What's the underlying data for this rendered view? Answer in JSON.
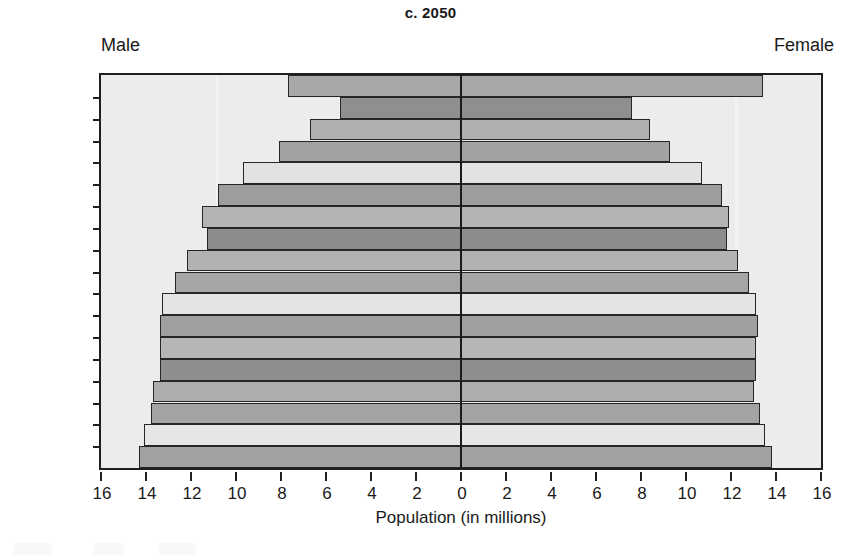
{
  "chart_data": {
    "type": "bar",
    "subtype": "population-pyramid",
    "title": "c. 2050",
    "xlabel": "Population (in millions)",
    "ylabel": "",
    "left_series_label": "Male",
    "right_series_label": "Female",
    "categories": [
      "85+",
      "80–84",
      "75–79",
      "70–74",
      "65–69",
      "60–64",
      "55–59",
      "50–54",
      "45–49",
      "40–44",
      "35–39",
      "30–34",
      "25–29",
      "20–24",
      "15–19",
      "10–14",
      "5–9",
      "0–4"
    ],
    "series": [
      {
        "name": "Male",
        "side": "left",
        "values": [
          7.7,
          5.4,
          6.7,
          8.1,
          9.7,
          10.8,
          11.5,
          11.3,
          12.2,
          12.7,
          13.3,
          13.4,
          13.4,
          13.4,
          13.7,
          13.8,
          14.1,
          14.3
        ]
      },
      {
        "name": "Female",
        "side": "right",
        "values": [
          13.4,
          7.6,
          8.4,
          9.3,
          10.7,
          11.6,
          11.9,
          11.8,
          12.3,
          12.8,
          13.1,
          13.2,
          13.1,
          13.1,
          13.0,
          13.3,
          13.5,
          13.8
        ]
      }
    ],
    "bar_shades": [
      "#a8a8a8",
      "#8f8f8f",
      "#b0b0b0",
      "#a2a2a2",
      "#e2e2e2",
      "#9d9d9d",
      "#b4b4b4",
      "#8c8c8c",
      "#b2b2b2",
      "#a5a5a5",
      "#e4e4e4",
      "#a0a0a0",
      "#b6b6b6",
      "#8e8e8e",
      "#adadad",
      "#a3a3a3",
      "#e6e6e6",
      "#a1a1a1"
    ],
    "xlim": [
      -16,
      16
    ],
    "xticks": [
      -16,
      -14,
      -12,
      -10,
      -8,
      -6,
      -4,
      -2,
      0,
      2,
      4,
      6,
      8,
      10,
      12,
      14,
      16
    ],
    "xtick_labels": [
      "16",
      "14",
      "12",
      "10",
      "8",
      "6",
      "4",
      "2",
      "0",
      "2",
      "4",
      "6",
      "8",
      "10",
      "12",
      "14",
      "16"
    ],
    "grid": false,
    "legend": "none",
    "plot_background": "#ececec",
    "axis_color": "#1f1f1f"
  }
}
